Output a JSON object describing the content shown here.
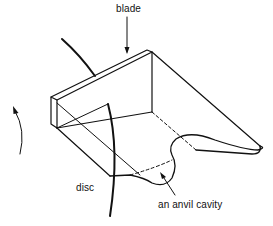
{
  "figure": {
    "labels": {
      "blade": "blade",
      "disc": "disc",
      "cavity": "an anvil cavity"
    },
    "colors": {
      "line": "#111111",
      "background": "#ffffff"
    },
    "icons": {
      "rotation_arrow": "curved-arrow-up-icon",
      "blade_pointer": "arrow-down-icon",
      "cavity_pointer": "arrow-up-left-icon"
    }
  }
}
